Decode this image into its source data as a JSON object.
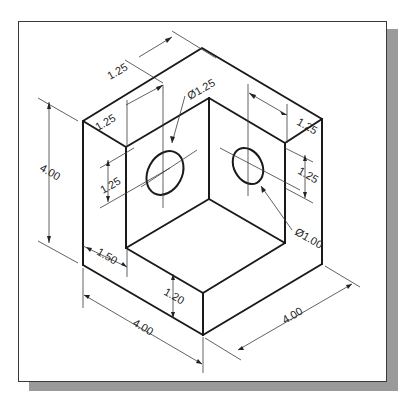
{
  "drawing": {
    "type": "isometric technical drawing",
    "object": "L-bracket corner block with two holes",
    "line_color": "#1a1a1a",
    "frame_color": "#3a3a3a",
    "shadow_color": "#9a9a9a",
    "dimensions": {
      "top_back_depth": "1.25",
      "left_hole_offset": "1.25",
      "left_hole_diameter": "Ø1.25",
      "right_hole_offset": "1.25",
      "left_hole_height": "1.25",
      "right_hole_height": "1.25",
      "right_hole_diameter": "Ø1.00",
      "overall_height": "4.00",
      "wall_thickness": "1.50",
      "base_thickness": "1.20",
      "overall_width_left": "4.00",
      "overall_width_right": "4.00"
    }
  }
}
